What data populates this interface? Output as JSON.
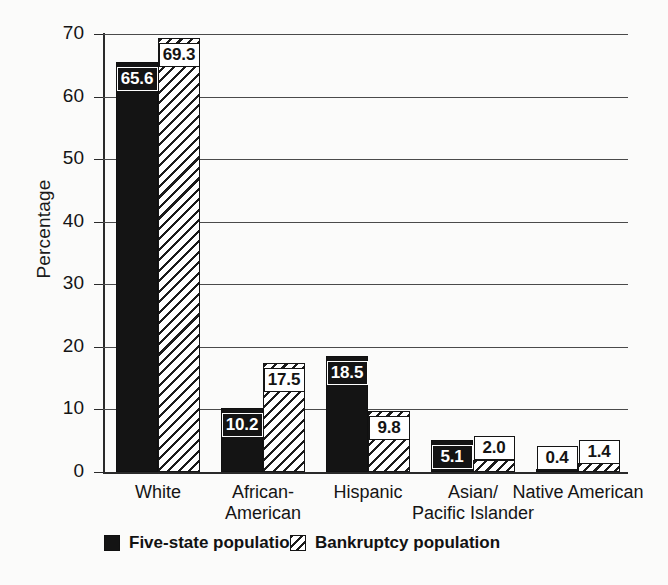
{
  "chart_data": {
    "type": "bar",
    "title": "",
    "xlabel": "",
    "ylabel": "Percentage",
    "ylim": [
      0,
      70
    ],
    "yticks": [
      0,
      10,
      20,
      30,
      40,
      50,
      60,
      70
    ],
    "ytick_labels": [
      "0",
      "10",
      "20",
      "30",
      "40",
      "50",
      "60",
      "70"
    ],
    "grid": true,
    "legend_position": "bottom-left",
    "categories": [
      "White",
      "African-American",
      "Hispanic",
      "Asian/Pacific Islander",
      "Native American"
    ],
    "category_lines": [
      [
        "White"
      ],
      [
        "African-",
        "American"
      ],
      [
        "Hispanic"
      ],
      [
        "Asian/",
        "Pacific Islander"
      ],
      [
        "Native American"
      ]
    ],
    "series": [
      {
        "name": "Five-state population",
        "fill": "solid",
        "values": [
          65.6,
          10.2,
          18.5,
          5.1,
          0.4
        ],
        "labels": [
          "65.6",
          "10.2",
          "18.5",
          "5.1",
          "0.4"
        ]
      },
      {
        "name": "Bankruptcy population",
        "fill": "hatched",
        "values": [
          69.3,
          17.5,
          9.8,
          2.0,
          1.4
        ],
        "labels": [
          "69.3",
          "17.5",
          "9.8",
          "2.0",
          "1.4"
        ]
      }
    ],
    "colors": {
      "series_solid": "#141414",
      "series_hatch_line": "#1b1b1b",
      "series_hatch_background": "#ffffff",
      "axis": "#2a2a2a",
      "gridline": "#4a4a4a",
      "background": "#fbfbfa",
      "text": "#141414"
    }
  },
  "legend": {
    "entries": [
      {
        "label": "Five-state population",
        "swatch": "solid-black-swatch"
      },
      {
        "label": "Bankruptcy population",
        "swatch": "diagonal-hatch-swatch"
      }
    ]
  }
}
